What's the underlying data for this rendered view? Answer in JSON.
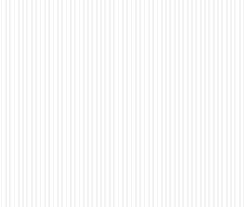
{
  "image": {
    "title": "Three spotted potatoes",
    "subject": "potato-tubers",
    "medium": "scanned black-and-white photograph",
    "background_color": "#ffffff",
    "width": 244,
    "height": 207,
    "color_mode": "grayscale",
    "palette": {
      "paper_white": "#ffffff",
      "skin_highlight": "#f2f1ee",
      "skin_midtone": "#cfcdc7",
      "skin_shadow": "#9b9893",
      "deep_shadow": "#4e4c49",
      "spot_dark": "#3a3937",
      "spot_mid": "#6b6966"
    }
  },
  "subjects": [
    {
      "id": "potato-top",
      "label": "top potato",
      "shape": "oval",
      "center_x": 137,
      "center_y": 56,
      "radius_x": 57,
      "radius_y": 50,
      "rotation_deg": -14,
      "spot_count": 34,
      "spot_density": "moderate",
      "notes": "elongated oval lying on its side, lit from upper left"
    },
    {
      "id": "potato-left",
      "label": "left potato",
      "shape": "rounded-heart",
      "center_x": 68,
      "center_y": 119,
      "radius_x": 57,
      "radius_y": 59,
      "rotation_deg": 8,
      "spot_count": 38,
      "spot_density": "moderate",
      "notes": "angular shoulder at upper left, dark irregular blemish near left flank"
    },
    {
      "id": "potato-right",
      "label": "right potato",
      "shape": "round",
      "center_x": 168,
      "center_y": 128,
      "radius_x": 63,
      "radius_y": 62,
      "rotation_deg": -4,
      "spot_count": 56,
      "spot_density": "heavy",
      "notes": "largest and most heavily spotted, bright highlight lower centre"
    }
  ],
  "caption": {
    "present": true,
    "description": "faint cut-off tops of printed characters along the lower edge",
    "visible_text": "",
    "marks": [
      {
        "x": 52,
        "y": 7,
        "w": 5,
        "h": 3,
        "opacity": 0.55,
        "skew": -18
      },
      {
        "x": 60,
        "y": 9,
        "w": 3,
        "h": 2,
        "opacity": 0.4,
        "skew": 0
      },
      {
        "x": 76,
        "y": 4,
        "w": 3,
        "h": 9,
        "opacity": 0.85,
        "skew": 0
      },
      {
        "x": 88,
        "y": 6,
        "w": 22,
        "h": 3,
        "opacity": 0.8,
        "skew": 0
      },
      {
        "x": 88,
        "y": 11,
        "w": 20,
        "h": 2,
        "opacity": 0.45,
        "skew": 0
      }
    ]
  }
}
